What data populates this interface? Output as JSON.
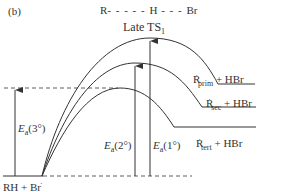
{
  "panel_label": "(b)",
  "ts_structure": {
    "left": "R",
    "middle": "H",
    "right": "Br"
  },
  "ts_label": {
    "text": "Late TS",
    "subscript": "1"
  },
  "reactant_label": {
    "text": "RH + Br",
    "radical_dot": "·"
  },
  "products": [
    {
      "radical": "R",
      "subscript": "prim",
      "rest": " + HBr"
    },
    {
      "radical": "R",
      "subscript": "sec",
      "rest": " + HBr"
    },
    {
      "radical": "R",
      "subscript": "tert",
      "rest": " + HBr"
    }
  ],
  "activation_energies": [
    {
      "symbol": "E",
      "subscript": "a",
      "paren": "(3°)"
    },
    {
      "symbol": "E",
      "subscript": "a",
      "paren": "(2°)"
    },
    {
      "symbol": "E",
      "subscript": "a",
      "paren": "(1°)"
    }
  ],
  "colors": {
    "line": "#333333",
    "background": "#ffffff"
  }
}
